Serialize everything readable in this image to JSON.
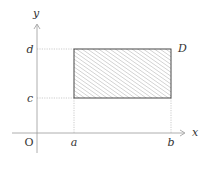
{
  "diagram": {
    "type": "region-in-plane",
    "axes": {
      "x_label": "x",
      "y_label": "y",
      "origin_label": "O"
    },
    "ticks": {
      "x": [
        "a",
        "b"
      ],
      "y": [
        "c",
        "d"
      ]
    },
    "region": {
      "label": "D",
      "fill": "diagonal-hatch"
    },
    "colors": {
      "axis": "#999999",
      "guide": "#aaaaaa",
      "border": "#333333",
      "hatch": "#888888",
      "text": "#333333"
    }
  }
}
